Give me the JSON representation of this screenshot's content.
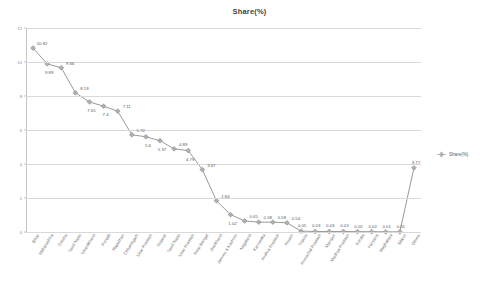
{
  "chart_data": {
    "type": "line",
    "title": "Share(%)",
    "xlabel": "",
    "ylabel": "",
    "ylim": [
      0,
      12
    ],
    "yticks": [
      0,
      2,
      4,
      6,
      8,
      10,
      12
    ],
    "ytick_labels": [
      "0",
      "2",
      "4",
      "6",
      "8",
      "10",
      "12"
    ],
    "grid": true,
    "legend_position": "right",
    "series": [
      {
        "name": "Share(%)",
        "color": "#9a9a9a",
        "marker": "diamond",
        "values": [
          10.82,
          9.89,
          9.66,
          8.19,
          7.65,
          7.4,
          7.11,
          5.72,
          5.6,
          5.37,
          4.89,
          4.79,
          3.67,
          1.84,
          1.02,
          0.65,
          0.58,
          0.58,
          0.54,
          0.05,
          0.03,
          0.03,
          0.03,
          0.02,
          0.02,
          0.01,
          0.01,
          3.77
        ]
      }
    ],
    "categories": [
      "Bihar",
      "Maharashtra",
      "Odisha",
      "Tamil Nadu",
      "Uttarakhand",
      "Punjab",
      "Rajasthan",
      "Chhattisgarh",
      "Uttar Pradesh",
      "Gujarat",
      "Tamil Nadu",
      "Uttar Pradesh",
      "West Bengal",
      "Jharkhand",
      "Jammu & Kashmir",
      "Nagaland",
      "Karnataka",
      "Andhra Pradesh",
      "Assam",
      "Tripura",
      "Arunachal Pradesh",
      "Manipur",
      "Madhya Pradesh",
      "Kerala",
      "Haryana",
      "Meghalaya",
      "Sikkim",
      "Others"
    ],
    "point_labels": [
      "10.82",
      "9.89",
      "9.66",
      "8.19",
      "7.65",
      "7.4",
      "7.11",
      "5.72",
      "5.6",
      "5.37",
      "4.89",
      "4.79",
      "3.67",
      "1.84",
      "1.02",
      "0.65",
      "0.58",
      "0.58",
      "0.54",
      "0.05",
      "0.03",
      "0.03",
      "0.03",
      "0.02",
      "0.02",
      "0.01",
      "0.01",
      "3.77"
    ]
  },
  "legend": {
    "entries": [
      {
        "label": "Share(%)",
        "color": "#9a9a9a"
      }
    ]
  },
  "colors": {
    "line": "#9a9a9a",
    "marker": "#a6a6a6",
    "grid": "#d9d9d9",
    "axis": "#c4c4c4",
    "title": "#3f3f3f",
    "tick_text": "#8c8c8c",
    "label_text": "#5a5a5a",
    "background": "#ffffff"
  }
}
